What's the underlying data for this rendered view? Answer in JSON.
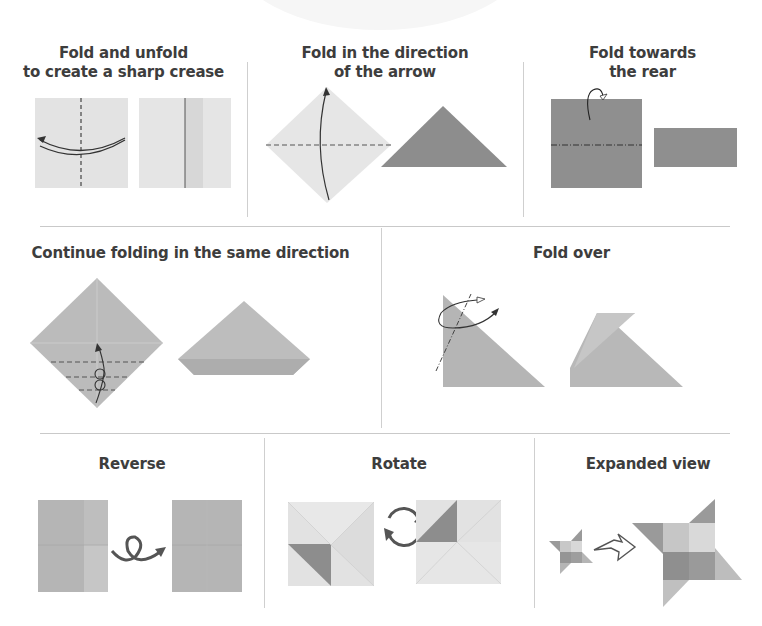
{
  "page": {
    "kind": "origami instruction legend",
    "colors": {
      "paper_light": "#e4e4e4",
      "paper_mid": "#b9b9b9",
      "paper_dark": "#8e8e8e",
      "line": "#3a3a3a",
      "divider": "#cfcfcf"
    }
  },
  "rows": [
    {
      "panels": [
        {
          "title_line1": "Fold and unfold",
          "title_line2": "to create a sharp crease",
          "icon": "fold-unfold-diagram"
        },
        {
          "title_line1": "Fold in the direction",
          "title_line2": "of the arrow",
          "icon": "fold-direction-diagram"
        },
        {
          "title_line1": "Fold towards",
          "title_line2": "the rear",
          "icon": "fold-rear-diagram"
        }
      ]
    },
    {
      "panels": [
        {
          "title_line1": "Continue folding in the same direction",
          "icon": "continue-folding-diagram"
        },
        {
          "title_line1": "Fold over",
          "icon": "fold-over-diagram"
        }
      ]
    },
    {
      "panels": [
        {
          "title_line1": "Reverse",
          "icon": "reverse-diagram"
        },
        {
          "title_line1": "Rotate",
          "icon": "rotate-diagram"
        },
        {
          "title_line1": "Expanded view",
          "icon": "expanded-view-diagram"
        }
      ]
    }
  ]
}
